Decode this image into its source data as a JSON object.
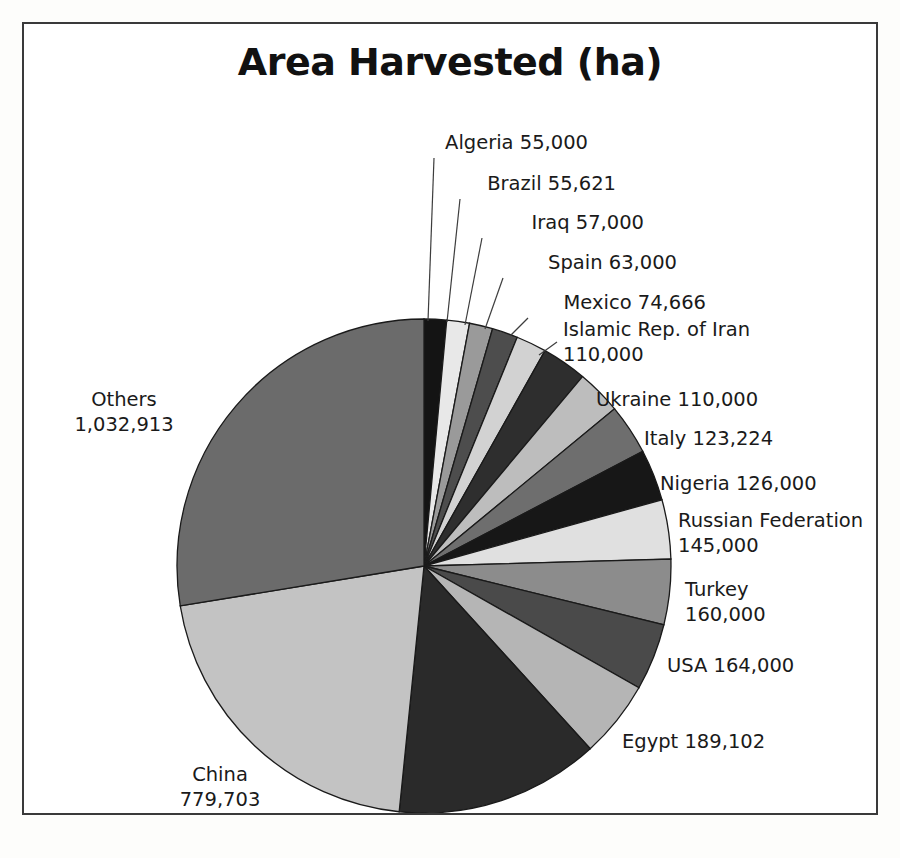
{
  "document": {
    "background_ghost_text": {
      "top": "",
      "left": "",
      "right": "",
      "bottom_left": "",
      "bottom_right": ""
    }
  },
  "chart_data": {
    "type": "pie",
    "title": "Area Harvested (ha)",
    "unit": "ha",
    "legend_position": "outside-labels-with-leaders",
    "total": 3645229,
    "start_angle_deg": 0,
    "direction": "clockwise",
    "categories": [
      "Algeria",
      "Brazil",
      "Iraq",
      "Spain",
      "Mexico",
      "Islamic Rep. of Iran",
      "Ukraine",
      "Italy",
      "Nigeria",
      "Russian Federation",
      "Turkey",
      "USA",
      "Egypt",
      "India",
      "China",
      "Others"
    ],
    "values": [
      55000,
      55621,
      57000,
      63000,
      74666,
      110000,
      110000,
      123224,
      126000,
      145000,
      160000,
      164000,
      189102,
      500000,
      779703,
      1032913
    ],
    "value_labels": [
      "55,000",
      "55,621",
      "57,000",
      "63,000",
      "74,666",
      "110,000",
      "110,000",
      "123,224",
      "126,000",
      "145,000",
      "160,000",
      "164,000",
      "189,102",
      "500,000",
      "779,703",
      "1,032,913"
    ],
    "slice_colors": [
      "#141414",
      "#e8e8e8",
      "#9a9a9a",
      "#4d4d4d",
      "#d2d2d2",
      "#2e2e2e",
      "#bdbdbd",
      "#6e6e6e",
      "#171717",
      "#e0e0e0",
      "#8c8c8c",
      "#4a4a4a",
      "#b5b5b5",
      "#2a2a2a",
      "#c3c3c3",
      "#6b6b6b"
    ],
    "slice_stroke": "#1a1a1a",
    "labels": [
      {
        "name": "Algeria",
        "text": "Algeria 55,000",
        "lines": [
          "Algeria 55,000"
        ],
        "anchor": "end",
        "x": 564,
        "y": 125,
        "leader": [
          [
            410,
            134
          ],
          [
            404,
            297
          ]
        ]
      },
      {
        "name": "Brazil",
        "text": "Brazil 55,621",
        "lines": [
          "Brazil 55,621"
        ],
        "anchor": "end",
        "x": 592,
        "y": 166,
        "leader": [
          [
            436,
            175
          ],
          [
            423,
            298
          ]
        ]
      },
      {
        "name": "Iraq",
        "text": "Iraq 57,000",
        "lines": [
          "Iraq 57,000"
        ],
        "anchor": "end",
        "x": 620,
        "y": 205,
        "leader": [
          [
            458,
            214
          ],
          [
            441,
            301
          ]
        ]
      },
      {
        "name": "Spain",
        "text": "Spain 63,000",
        "lines": [
          "Spain 63,000"
        ],
        "anchor": "end",
        "x": 653,
        "y": 245,
        "leader": [
          [
            479,
            254
          ],
          [
            461,
            305
          ]
        ]
      },
      {
        "name": "Mexico",
        "text": "Mexico 74,666",
        "lines": [
          "Mexico 74,666"
        ],
        "anchor": "end",
        "x": 682,
        "y": 285,
        "leader": [
          [
            504,
            294
          ],
          [
            486,
            312
          ]
        ]
      },
      {
        "name": "Islamic Rep. of Iran",
        "text": "Islamic Rep. of Iran 110,000",
        "lines": [
          "Islamic Rep. of Iran",
          "110,000"
        ],
        "anchor": "start",
        "x": 539,
        "y": 312,
        "leader": [
          [
            533,
            318
          ],
          [
            515,
            331
          ]
        ]
      },
      {
        "name": "Ukraine",
        "text": "Ukraine 110,000",
        "lines": [
          "Ukraine 110,000"
        ],
        "anchor": "start",
        "x": 572,
        "y": 382,
        "leader": null
      },
      {
        "name": "Italy",
        "text": "Italy 123,224",
        "lines": [
          "Italy 123,224"
        ],
        "anchor": "start",
        "x": 620,
        "y": 421,
        "leader": null
      },
      {
        "name": "Nigeria",
        "text": "Nigeria 126,000",
        "lines": [
          "Nigeria 126,000"
        ],
        "anchor": "start",
        "x": 636,
        "y": 466,
        "leader": null
      },
      {
        "name": "Russian Federation",
        "text": "Russian Federation 145,000",
        "lines": [
          "Russian Federation",
          "145,000"
        ],
        "anchor": "start",
        "x": 654,
        "y": 503,
        "leader": null
      },
      {
        "name": "Turkey",
        "text": "Turkey 160,000",
        "lines": [
          "Turkey",
          "160,000"
        ],
        "anchor": "start",
        "x": 661,
        "y": 572,
        "leader": null
      },
      {
        "name": "USA",
        "text": "USA 164,000",
        "lines": [
          "USA 164,000"
        ],
        "anchor": "start",
        "x": 643,
        "y": 648,
        "leader": null
      },
      {
        "name": "Egypt",
        "text": "Egypt 189,102",
        "lines": [
          "Egypt 189,102"
        ],
        "anchor": "start",
        "x": 598,
        "y": 724,
        "leader": null
      },
      {
        "name": "India",
        "text": "India 500,000",
        "lines": [
          "India 500,000"
        ],
        "anchor": "start",
        "x": 468,
        "y": 805,
        "leader": null
      },
      {
        "name": "China",
        "text": "China 779,703",
        "lines": [
          "China",
          "779,703"
        ],
        "anchor": "middle",
        "x": 196,
        "y": 757,
        "leader": null
      },
      {
        "name": "Others",
        "text": "Others 1,032,913",
        "lines": [
          "Others",
          "1,032,913"
        ],
        "anchor": "middle",
        "x": 100,
        "y": 382,
        "leader": null
      }
    ],
    "geometry": {
      "cx": 400,
      "cy": 542,
      "r": 247
    }
  }
}
